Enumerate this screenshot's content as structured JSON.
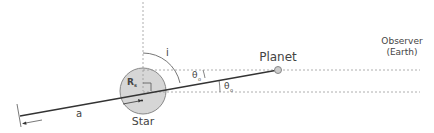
{
  "diagram": {
    "labels": {
      "planet": "Planet",
      "observer_line1": "Observer",
      "observer_line2": "(Earth)",
      "star": "Star",
      "star_radius": "R",
      "star_radius_sub": "s",
      "inclination": "i",
      "theta_upper": "θ",
      "theta_upper_sub": "o",
      "theta_lower": "θ",
      "theta_lower_sub": "o",
      "semi_major_axis": "a"
    },
    "colors": {
      "line": "#333333",
      "dashed": "#999999",
      "star_fill": "#d6d6d6",
      "star_stroke": "#888888",
      "text": "#444444"
    }
  }
}
